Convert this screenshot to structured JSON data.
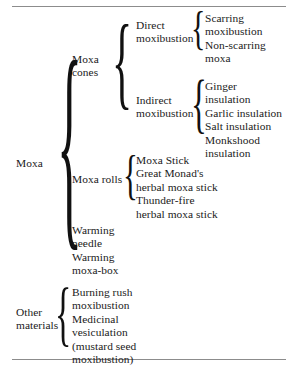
{
  "figure": {
    "type": "brace-taxonomy-tree",
    "orientation": "left-to-right",
    "levels": 4,
    "rules": {
      "top": true,
      "bottom": true
    },
    "brace_glyph": "{"
  },
  "root": {
    "label": "Moxa"
  },
  "branches": {
    "moxa_cones": {
      "label": "Moxa\ncones",
      "children": {
        "direct": {
          "label": "Direct\nmoxibustion",
          "leaves": "Scarring\nmoxibustion\nNon-scarring\nmoxa"
        },
        "indirect": {
          "label": "Indirect\nmoxibustion",
          "leaves": "Ginger\ninsulation\nGarlic insulation\nSalt insulation\nMonkshood\ninsulation"
        }
      }
    },
    "moxa_rolls": {
      "label": "Moxa rolls",
      "leaves": "Moxa Stick\nGreat Monad's\nherbal moxa stick\nThunder-fire\nherbal moxa stick"
    },
    "warming": {
      "leaves": "Warming\nneedle\nWarming\nmoxa-box"
    }
  },
  "other_materials": {
    "label": "Other\nmaterials",
    "leaves": "Burning rush\nmoxibustion\nMedicinal\nvesiculation\n(mustard seed\nmoxibustion)"
  },
  "colors": {
    "text": "#1a1a1a",
    "rule": "#8c8c8c",
    "background": "#ffffff"
  }
}
